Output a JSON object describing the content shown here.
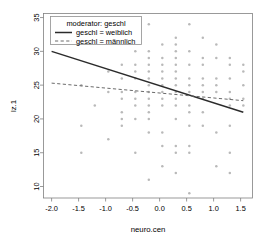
{
  "chart_data": {
    "type": "scatter",
    "title": "",
    "xlabel": "neuro.cen",
    "ylabel": "lz.1",
    "xlim": [
      -2.15,
      1.72
    ],
    "ylim": [
      8.3,
      35.6
    ],
    "xticks": [
      -2.0,
      -1.5,
      -1.0,
      -0.5,
      0.0,
      0.5,
      1.0,
      1.5
    ],
    "xtick_labels": [
      "-2.0",
      "-1.5",
      "-1.0",
      "-0.5",
      "0.0",
      "0.5",
      "1.0",
      "1.5"
    ],
    "yticks": [
      10,
      15,
      20,
      25,
      30,
      35
    ],
    "ytick_labels": [
      "10",
      "15",
      "20",
      "25",
      "30",
      "35"
    ],
    "grid": false,
    "legend_position": "top-left",
    "legend_title": "moderator: geschl",
    "series": [
      {
        "name": "geschl = weiblich",
        "style": "solid",
        "color": "#2b2b2b",
        "line": {
          "x": [
            -2.0,
            1.55
          ],
          "y": [
            30.0,
            21.0
          ]
        }
      },
      {
        "name": "geschl = männlich",
        "style": "dashed",
        "color": "#6b6b6b",
        "line": {
          "x": [
            -2.0,
            1.55
          ],
          "y": [
            25.3,
            22.7
          ]
        }
      }
    ],
    "points_color": "#b9b9b9",
    "points": [
      [
        -1.45,
        25.0
      ],
      [
        -1.45,
        19.0
      ],
      [
        -1.45,
        15.0
      ],
      [
        -1.2,
        22.0
      ],
      [
        -0.95,
        27.0
      ],
      [
        -0.95,
        24.0
      ],
      [
        -0.95,
        17.0
      ],
      [
        -0.7,
        28.0
      ],
      [
        -0.7,
        26.0
      ],
      [
        -0.7,
        24.0
      ],
      [
        -0.7,
        23.0
      ],
      [
        -0.7,
        21.0
      ],
      [
        -0.7,
        20.0
      ],
      [
        -0.7,
        19.0
      ],
      [
        -0.45,
        33.0
      ],
      [
        -0.45,
        30.0
      ],
      [
        -0.45,
        28.0
      ],
      [
        -0.45,
        27.0
      ],
      [
        -0.45,
        26.0
      ],
      [
        -0.45,
        24.0
      ],
      [
        -0.45,
        23.0
      ],
      [
        -0.45,
        22.0
      ],
      [
        -0.45,
        20.0
      ],
      [
        -0.45,
        15.0
      ],
      [
        -0.2,
        34.0
      ],
      [
        -0.2,
        30.0
      ],
      [
        -0.2,
        29.0
      ],
      [
        -0.2,
        28.0
      ],
      [
        -0.2,
        27.0
      ],
      [
        -0.2,
        26.0
      ],
      [
        -0.2,
        25.0
      ],
      [
        -0.2,
        24.0
      ],
      [
        -0.2,
        23.0
      ],
      [
        -0.2,
        22.0
      ],
      [
        -0.2,
        21.0
      ],
      [
        -0.2,
        20.0
      ],
      [
        -0.2,
        18.0
      ],
      [
        -0.2,
        11.0
      ],
      [
        0.05,
        31.0
      ],
      [
        0.05,
        29.0
      ],
      [
        0.05,
        28.0
      ],
      [
        0.05,
        27.0
      ],
      [
        0.05,
        26.0
      ],
      [
        0.05,
        25.0
      ],
      [
        0.05,
        24.0
      ],
      [
        0.05,
        23.0
      ],
      [
        0.05,
        22.0
      ],
      [
        0.05,
        18.0
      ],
      [
        0.05,
        16.0
      ],
      [
        0.05,
        13.0
      ],
      [
        0.3,
        32.0
      ],
      [
        0.3,
        31.0
      ],
      [
        0.3,
        30.0
      ],
      [
        0.3,
        29.0
      ],
      [
        0.3,
        28.0
      ],
      [
        0.3,
        27.0
      ],
      [
        0.3,
        26.0
      ],
      [
        0.3,
        25.0
      ],
      [
        0.3,
        24.0
      ],
      [
        0.3,
        23.0
      ],
      [
        0.3,
        22.0
      ],
      [
        0.3,
        20.0
      ],
      [
        0.3,
        16.0
      ],
      [
        0.3,
        15.0
      ],
      [
        0.3,
        12.0
      ],
      [
        0.55,
        34.0
      ],
      [
        0.55,
        30.0
      ],
      [
        0.55,
        28.0
      ],
      [
        0.55,
        26.0
      ],
      [
        0.55,
        25.0
      ],
      [
        0.55,
        24.0
      ],
      [
        0.55,
        22.0
      ],
      [
        0.55,
        21.0
      ],
      [
        0.55,
        19.0
      ],
      [
        0.55,
        16.0
      ],
      [
        0.55,
        15.0
      ],
      [
        0.55,
        9.0
      ],
      [
        0.8,
        32.0
      ],
      [
        0.8,
        29.0
      ],
      [
        0.8,
        28.0
      ],
      [
        0.8,
        26.0
      ],
      [
        0.8,
        25.0
      ],
      [
        0.8,
        24.0
      ],
      [
        0.8,
        23.0
      ],
      [
        0.8,
        21.0
      ],
      [
        0.8,
        19.0
      ],
      [
        1.05,
        31.0
      ],
      [
        1.05,
        29.0
      ],
      [
        1.05,
        26.0
      ],
      [
        1.05,
        25.0
      ],
      [
        1.05,
        24.0
      ],
      [
        1.05,
        18.0
      ],
      [
        1.05,
        13.0
      ],
      [
        1.3,
        29.0
      ],
      [
        1.3,
        28.0
      ],
      [
        1.3,
        26.0
      ],
      [
        1.3,
        24.0
      ],
      [
        1.3,
        23.0
      ],
      [
        1.3,
        22.0
      ],
      [
        1.3,
        19.0
      ],
      [
        1.3,
        15.0
      ],
      [
        1.3,
        12.0
      ],
      [
        1.55,
        28.0
      ],
      [
        1.55,
        27.0
      ],
      [
        1.55,
        25.0
      ],
      [
        1.55,
        23.0
      ],
      [
        1.55,
        22.0
      ]
    ]
  }
}
